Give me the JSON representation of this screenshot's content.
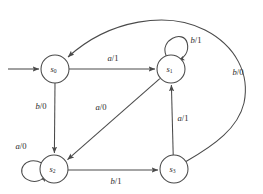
{
  "diagram": {
    "type": "state-transition-diagram",
    "kind": "mealy-machine",
    "stroke_color": "#4a4a4a",
    "background_color": "#ffffff",
    "states": [
      {
        "id": "s0",
        "name": "s",
        "subscript": "0",
        "cx": 55,
        "cy": 69,
        "r": 14,
        "initial": true
      },
      {
        "id": "s1",
        "name": "s",
        "subscript": "1",
        "cx": 171,
        "cy": 69,
        "r": 14,
        "initial": false
      },
      {
        "id": "s2",
        "name": "s",
        "subscript": "2",
        "cx": 54,
        "cy": 169,
        "r": 14,
        "initial": false
      },
      {
        "id": "s3",
        "name": "s",
        "subscript": "3",
        "cx": 174,
        "cy": 169,
        "r": 14,
        "initial": false
      }
    ],
    "transitions": [
      {
        "id": "t-s0-s1",
        "from": "s0",
        "to": "s1",
        "input": "a",
        "output": "1",
        "label": "a/1",
        "label_x": 113,
        "label_y": 59,
        "shape": "straight-horizontal"
      },
      {
        "id": "t-s0-s2",
        "from": "s0",
        "to": "s2",
        "input": "b",
        "output": "0",
        "label": "b/0",
        "label_x": 41,
        "label_y": 107,
        "shape": "straight-vertical"
      },
      {
        "id": "t-s1-s2",
        "from": "s1",
        "to": "s2",
        "input": "a",
        "output": "0",
        "label": "a/0",
        "label_x": 101,
        "label_y": 108,
        "shape": "diagonal"
      },
      {
        "id": "t-s1-s1",
        "from": "s1",
        "to": "s1",
        "input": "b",
        "output": "1",
        "label": "b/1",
        "label_x": 196,
        "label_y": 41,
        "shape": "self-loop-top"
      },
      {
        "id": "t-s2-s2",
        "from": "s2",
        "to": "s2",
        "input": "a",
        "output": "0",
        "label": "a/0",
        "label_x": 21,
        "label_y": 147,
        "shape": "self-loop-left"
      },
      {
        "id": "t-s2-s3",
        "from": "s2",
        "to": "s3",
        "input": "b",
        "output": "1",
        "label": "b/1",
        "label_x": 116,
        "label_y": 182,
        "shape": "straight-horizontal"
      },
      {
        "id": "t-s3-s1",
        "from": "s3",
        "to": "s1",
        "input": "a",
        "output": "1",
        "label": "a/1",
        "label_x": 183,
        "label_y": 119,
        "shape": "straight-vertical"
      },
      {
        "id": "t-s3-s0",
        "from": "s3",
        "to": "s0",
        "input": "b",
        "output": "0",
        "label": "b/0",
        "label_x": 238,
        "label_y": 73,
        "shape": "long-curve-right-top"
      }
    ],
    "caption": ""
  }
}
